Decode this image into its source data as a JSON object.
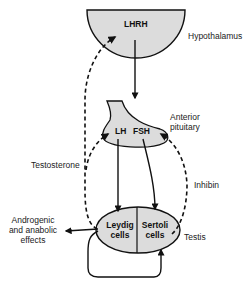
{
  "diagram": {
    "nodes": {
      "hypothalamus": {
        "hormone": "LHRH",
        "label": "Hypothalamus"
      },
      "pituitary": {
        "label_line1": "Anterior",
        "label_line2": "pituitary",
        "hormone_left": "LH",
        "hormone_right": "FSH"
      },
      "testis": {
        "label": "Testis",
        "left_cell_line1": "Leydig",
        "left_cell_line2": "cells",
        "right_cell_line1": "Sertoli",
        "right_cell_line2": "cells"
      }
    },
    "edge_labels": {
      "testosterone": "Testosterone",
      "inhibin": "Inhibin",
      "effects_line1": "Androgenic",
      "effects_line2": "and anabolic",
      "effects_line3": "effects"
    },
    "colors": {
      "fill": "#dcdcdc",
      "stroke": "#111111",
      "text": "#222222"
    }
  }
}
